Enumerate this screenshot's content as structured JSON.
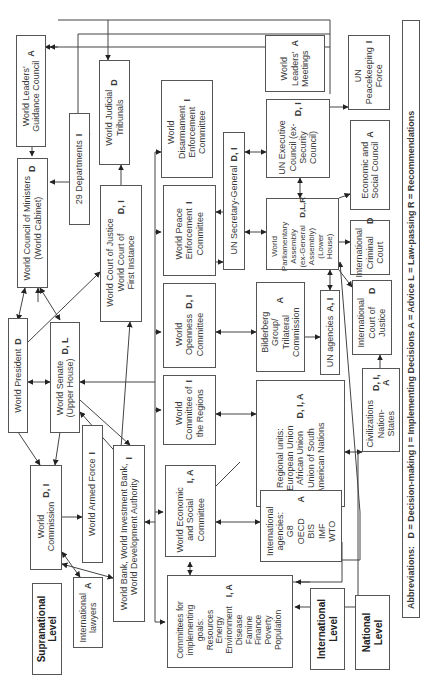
{
  "diagram": {
    "orientation": "rotated-90-ccw",
    "levels": [
      {
        "id": "supranational",
        "label": "Supranational\nLevel"
      },
      {
        "id": "international",
        "label": "International\nLevel"
      },
      {
        "id": "national",
        "label": "National\nLevel"
      }
    ],
    "nodes": {
      "leaders_guidance_council": {
        "label": "World Leaders'\nGuidance Council",
        "code": "A"
      },
      "council_of_ministers": {
        "label": "World Council of Ministers\n(World Cabinet)",
        "code": "D"
      },
      "departments": {
        "label": "29 Departments",
        "code": "I"
      },
      "judicial_tribunals": {
        "label": "World Judicial\nTribunals",
        "code": "D"
      },
      "world_court": {
        "label": "World Court of Justice\nWorld Court of\nFirst Instance",
        "code": "D, I"
      },
      "world_president": {
        "label": "World President",
        "code": "D"
      },
      "world_senate": {
        "label": "World Senate\n(Upper House)",
        "code": "D, L"
      },
      "world_commission": {
        "label": "World\nCommission",
        "code": "D, I"
      },
      "armed_force": {
        "label": "World Armed Force",
        "code": "I"
      },
      "world_bank": {
        "label": "World Bank, World Investment Bank,\nWorld Development Authority",
        "code": "I"
      },
      "intl_lawyers": {
        "label": "International\nlawyers",
        "code": "A"
      },
      "committees_goals": {
        "label": "Committees for\nimplementing\ngoals:\nResources\nEnergy\nEnvironment\nDisease\nFamine\nFinance\nPoverty\nPopulation",
        "code": "I, A"
      },
      "econ_social_committee": {
        "label": "World Economic\nand Social\nCommittee",
        "code": "I, A"
      },
      "committee_regions": {
        "label": "World\nCommittee of\nthe Regions",
        "code": "I"
      },
      "openness_committee": {
        "label": "World\nOpenness\nCommittee",
        "code": "D, I"
      },
      "peace_enforcement": {
        "label": "World Peace\nEnforcement\nCommittee",
        "code": "I"
      },
      "disarmament_enforcement": {
        "label": "World\nDisarmament\nEnforcement\nCommittee",
        "code": "I"
      },
      "un_secretary_general": {
        "label": "UN Secretary-General",
        "code": "D, I"
      },
      "bilderberg": {
        "label": "Bilderberg\nGroup/\nTrilateral\nCommission",
        "code": "A"
      },
      "regional_units": {
        "label": "Regional units:\nEuropean Union\nAfrican Union\nUnion of South\nAmerican Nations",
        "code": "D, I, A"
      },
      "intl_agencies": {
        "label": "International\nagencies:\nG8\nOECD\nBIS\nIMF\nWTO",
        "code": "A"
      },
      "parliamentary_assembly": {
        "label": "World\nParliamentary\nAssembly\n(ex-General\nAssembly)\n(Lower\nHouse)",
        "code": "D,L,R"
      },
      "un_executive_council": {
        "label": "UN Executive\nCouncil (ex-\nSecurity\nCouncil)",
        "code": "D, I"
      },
      "leaders_meetings": {
        "label": "World\nLeaders'\nMeetings",
        "code": "A"
      },
      "un_agencies": {
        "label": "UN agencies",
        "code": "A, I"
      },
      "intl_criminal_court": {
        "label": "International\nCriminal\nCourt",
        "code": "D"
      },
      "econ_social_council": {
        "label": "Economic and\nSocial Council",
        "code": "A"
      },
      "un_peacekeeping": {
        "label": "UN\nPeacekeeping\nForce",
        "code": "I"
      },
      "intl_court_justice": {
        "label": "International\nCourt of\nJustice",
        "code": "D"
      },
      "civilizations": {
        "label": "Civilizations\nNation-States",
        "code": "D, I, A"
      }
    },
    "abbreviations": {
      "prefix": "Abbreviations:",
      "text": "D = Decision-making   I = Implementing Decisions   A = Advice   L = Law-passing   R = Recommendations"
    }
  }
}
